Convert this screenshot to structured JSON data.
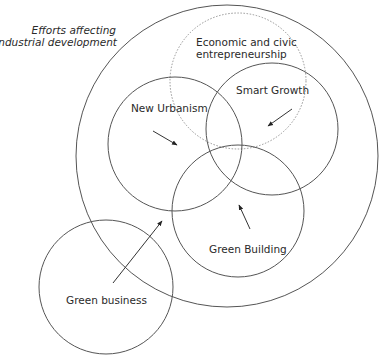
{
  "title": {
    "line1": "Efforts affecting",
    "line2": "eco-industrial development"
  },
  "circles": [
    {
      "id": "efforts-boundary",
      "label": "",
      "style": "solid"
    },
    {
      "id": "economic-civic",
      "label_line1": "Economic and civic",
      "label_line2": "entrepreneurship",
      "style": "dotted"
    },
    {
      "id": "new-urbanism",
      "label": "New Urbanism",
      "style": "solid"
    },
    {
      "id": "smart-growth",
      "label": "Smart Growth",
      "style": "solid"
    },
    {
      "id": "green-building",
      "label": "Green Building",
      "style": "solid"
    },
    {
      "id": "green-business",
      "label": "Green business",
      "style": "solid"
    }
  ],
  "arrows": [
    {
      "from": "new-urbanism",
      "direction": "toward center overlap"
    },
    {
      "from": "smart-growth",
      "direction": "toward center overlap"
    },
    {
      "from": "green-building",
      "direction": "toward center overlap"
    },
    {
      "from": "green-business",
      "direction": "into efforts circle"
    }
  ],
  "colors": {
    "stroke": "#555555",
    "dotted_stroke": "#8a8a8a",
    "text": "#2a2a2a",
    "background": "#ffffff"
  }
}
